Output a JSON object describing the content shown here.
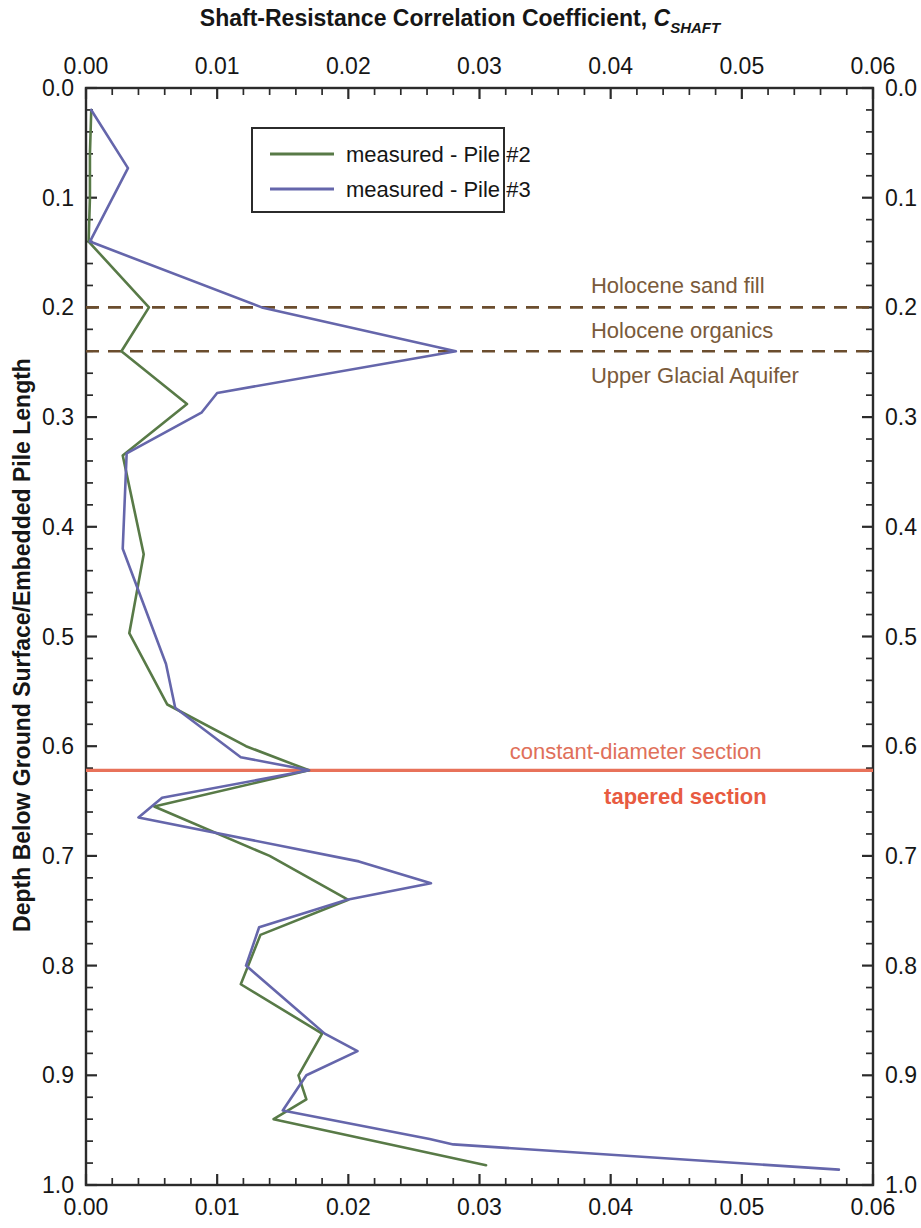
{
  "chart_data": {
    "type": "line",
    "title_main": "Shaft-Resistance Correlation Coefficient, ",
    "title_var": "C",
    "title_sub": "SHAFT",
    "xlabel": "Shaft-Resistance Correlation Coefficient, C SHAFT",
    "ylabel": "Depth Below Ground Surface/Embedded Pile Length",
    "xlim": [
      0.0,
      0.06
    ],
    "ylim": [
      0.0,
      1.0
    ],
    "y_inverted": true,
    "x_major_ticks": [
      0.0,
      0.01,
      0.02,
      0.03,
      0.04,
      0.05,
      0.06
    ],
    "x_tick_labels": [
      "0.00",
      "0.01",
      "0.02",
      "0.03",
      "0.04",
      "0.05",
      "0.06"
    ],
    "x_minor_interval": 0.002,
    "y_major_ticks": [
      0.0,
      0.1,
      0.2,
      0.3,
      0.4,
      0.5,
      0.6,
      0.7,
      0.8,
      0.9,
      1.0
    ],
    "y_tick_labels": [
      "0.0",
      "0.1",
      "0.2",
      "0.3",
      "0.4",
      "0.5",
      "0.6",
      "0.7",
      "0.8",
      "0.9",
      "1.0"
    ],
    "y_minor_interval": 0.02,
    "grid": false,
    "axes_on_all_sides": true,
    "legend_position": "top-center",
    "series": [
      {
        "name": "measured - Pile #2",
        "color": "#587a47",
        "width": 2.6,
        "points": [
          [
            0.0004,
            0.02
          ],
          [
            0.0003,
            0.06
          ],
          [
            0.0003,
            0.1
          ],
          [
            0.0002,
            0.14
          ],
          [
            0.0048,
            0.2
          ],
          [
            0.0027,
            0.24
          ],
          [
            0.0077,
            0.288
          ],
          [
            0.0028,
            0.335
          ],
          [
            0.0044,
            0.425
          ],
          [
            0.0033,
            0.497
          ],
          [
            0.0062,
            0.562
          ],
          [
            0.0122,
            0.6
          ],
          [
            0.017,
            0.622
          ],
          [
            0.0052,
            0.655
          ],
          [
            0.014,
            0.7
          ],
          [
            0.02,
            0.74
          ],
          [
            0.0133,
            0.772
          ],
          [
            0.0118,
            0.817
          ],
          [
            0.018,
            0.862
          ],
          [
            0.0162,
            0.9
          ],
          [
            0.0168,
            0.922
          ],
          [
            0.0143,
            0.94
          ],
          [
            0.0305,
            0.982
          ]
        ]
      },
      {
        "name": "measured - Pile #3",
        "color": "#6566ab",
        "width": 2.6,
        "points": [
          [
            0.0004,
            0.02
          ],
          [
            0.0032,
            0.073
          ],
          [
            0.0003,
            0.14
          ],
          [
            0.0134,
            0.2
          ],
          [
            0.0282,
            0.24
          ],
          [
            0.01,
            0.278
          ],
          [
            0.0088,
            0.296
          ],
          [
            0.0031,
            0.333
          ],
          [
            0.0028,
            0.42
          ],
          [
            0.0061,
            0.525
          ],
          [
            0.0068,
            0.565
          ],
          [
            0.0118,
            0.61
          ],
          [
            0.017,
            0.622
          ],
          [
            0.0058,
            0.647
          ],
          [
            0.004,
            0.665
          ],
          [
            0.0208,
            0.705
          ],
          [
            0.0263,
            0.725
          ],
          [
            0.0199,
            0.74
          ],
          [
            0.0132,
            0.765
          ],
          [
            0.0122,
            0.8
          ],
          [
            0.0182,
            0.862
          ],
          [
            0.0207,
            0.878
          ],
          [
            0.0168,
            0.9
          ],
          [
            0.015,
            0.932
          ],
          [
            0.0262,
            0.958
          ],
          [
            0.028,
            0.963
          ],
          [
            0.0574,
            0.986
          ]
        ]
      }
    ],
    "hlines": [
      {
        "label": "holocene-sand-fill-boundary",
        "y": 0.2,
        "color": "#6b4d2e",
        "style": "dashed",
        "width": 2.6
      },
      {
        "label": "holocene-organics-boundary",
        "y": 0.24,
        "color": "#6b4d2e",
        "style": "dashed",
        "width": 2.6
      },
      {
        "label": "pile-section-change",
        "y": 0.622,
        "color": "#e8725a",
        "style": "solid",
        "width": 3.2
      }
    ],
    "annotations": [
      {
        "text": "Holocene sand fill",
        "x": 0.0385,
        "y": 0.18,
        "color": "#7a5a3a",
        "bold": false,
        "anchor": "start"
      },
      {
        "text": "Holocene organics",
        "x": 0.0385,
        "y": 0.221,
        "color": "#7a5a3a",
        "bold": false,
        "anchor": "start"
      },
      {
        "text": "Upper Glacial Aquifer",
        "x": 0.0385,
        "y": 0.262,
        "color": "#7a5a3a",
        "bold": false,
        "anchor": "start"
      },
      {
        "text": "constant-diameter section",
        "x": 0.0323,
        "y": 0.604,
        "color": "#e0705a",
        "bold": false,
        "anchor": "start"
      },
      {
        "text": "tapered section",
        "x": 0.0395,
        "y": 0.645,
        "color": "#e85b41",
        "bold": true,
        "anchor": "start"
      }
    ]
  },
  "legend": {
    "entries": [
      {
        "label": "measured - Pile #2",
        "color": "#587a47"
      },
      {
        "label": "measured - Pile #3",
        "color": "#6566ab"
      }
    ]
  }
}
